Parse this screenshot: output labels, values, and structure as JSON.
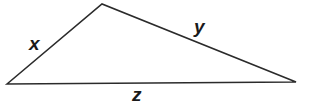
{
  "figure": {
    "name": "labeled-triangle",
    "type": "geometry-diagram",
    "background_color": "#ffffff",
    "stroke_color": "#2b2b2b",
    "label_color": "#1a1a1a",
    "stroke_width": 1.6,
    "vertices": {
      "left": {
        "x": 7,
        "y": 84
      },
      "apex": {
        "x": 102,
        "y": 4
      },
      "right": {
        "x": 296,
        "y": 82
      }
    },
    "sides": [
      {
        "id": "x",
        "label": "x",
        "from": "left",
        "to": "apex"
      },
      {
        "id": "y",
        "label": "y",
        "from": "apex",
        "to": "right"
      },
      {
        "id": "z",
        "label": "z",
        "from": "left",
        "to": "right"
      }
    ],
    "labels": {
      "x": "x",
      "y": "y",
      "z": "z"
    }
  }
}
